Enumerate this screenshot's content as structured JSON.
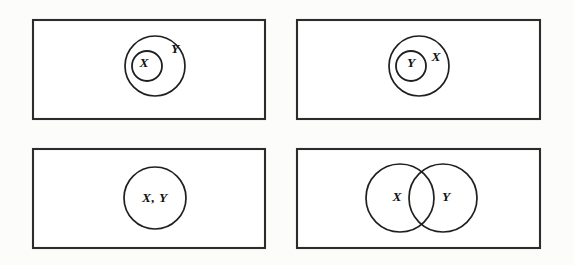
{
  "figure": {
    "background_color": "#fcfcfb",
    "rect_fill": "#ffffff",
    "line_color": "#1f1f1f",
    "rect_stroke_color": "#2c2c2c",
    "label_color": "#111111",
    "panels": [
      {
        "id": "panel-top-left",
        "position": "top-left",
        "relation": "X is a proper subset of Y",
        "shape": "nested-circles",
        "labels": [
          {
            "name": "inner-set-label",
            "text": "X",
            "x": 144,
            "y": 64
          },
          {
            "name": "outer-set-label",
            "text": "Y",
            "x": 175,
            "y": 50
          }
        ],
        "circles": [
          {
            "name": "outer-circle",
            "cx": 155,
            "cy": 66,
            "r": 30
          },
          {
            "name": "inner-circle",
            "cx": 147,
            "cy": 66,
            "r": 15
          }
        ],
        "rect": {
          "x": 33,
          "y": 20,
          "width": 232,
          "height": 99
        }
      },
      {
        "id": "panel-top-right",
        "position": "top-right",
        "relation": "Y is a proper subset of X",
        "shape": "nested-circles",
        "labels": [
          {
            "name": "inner-set-label",
            "text": "Y",
            "x": 411,
            "y": 64
          },
          {
            "name": "outer-set-label",
            "text": "X",
            "x": 436,
            "y": 58
          }
        ],
        "circles": [
          {
            "name": "outer-circle",
            "cx": 419,
            "cy": 66,
            "r": 30
          },
          {
            "name": "inner-circle",
            "cx": 411,
            "cy": 66,
            "r": 15
          }
        ],
        "rect": {
          "x": 297,
          "y": 20,
          "width": 243,
          "height": 99
        }
      },
      {
        "id": "panel-bottom-left",
        "position": "bottom-left",
        "relation": "X equals Y (coincident sets)",
        "shape": "single-circle",
        "labels": [
          {
            "name": "combined-set-label",
            "text": "X, Y",
            "x": 155,
            "y": 199
          }
        ],
        "circles": [
          {
            "name": "shared-circle",
            "cx": 155,
            "cy": 198,
            "r": 31
          }
        ],
        "rect": {
          "x": 33,
          "y": 149,
          "width": 232,
          "height": 99
        }
      },
      {
        "id": "panel-bottom-right",
        "position": "bottom-right",
        "relation": "X and Y overlap (partial intersection)",
        "shape": "overlapping-circles",
        "labels": [
          {
            "name": "left-set-label",
            "text": "X",
            "x": 397,
            "y": 198
          },
          {
            "name": "right-set-label",
            "text": "Y",
            "x": 446,
            "y": 198
          }
        ],
        "circles": [
          {
            "name": "left-circle",
            "cx": 400,
            "cy": 198,
            "r": 34
          },
          {
            "name": "right-circle",
            "cx": 443,
            "cy": 198,
            "r": 34
          }
        ],
        "rect": {
          "x": 297,
          "y": 149,
          "width": 243,
          "height": 99
        }
      }
    ]
  }
}
